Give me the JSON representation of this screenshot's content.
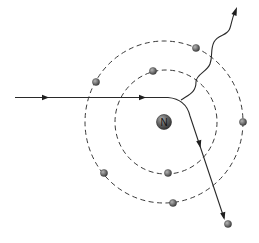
{
  "diagram": {
    "type": "atom-scattering",
    "nucleus": {
      "label": "N",
      "cx": 164,
      "cy": 122,
      "r": 7.5
    },
    "orbits": [
      {
        "name": "inner-orbit",
        "cx": 166,
        "cy": 122,
        "rx": 51,
        "ry": 52
      },
      {
        "name": "outer-orbit",
        "cx": 164,
        "cy": 122,
        "rx": 79,
        "ry": 81
      }
    ],
    "electrons": [
      {
        "cx": 96,
        "cy": 82
      },
      {
        "cx": 153,
        "cy": 71
      },
      {
        "cx": 196,
        "cy": 48
      },
      {
        "cx": 243,
        "cy": 122
      },
      {
        "cx": 104,
        "cy": 173
      },
      {
        "cx": 168,
        "cy": 173
      },
      {
        "cx": 173,
        "cy": 203
      },
      {
        "cx": 228,
        "cy": 224
      }
    ],
    "incident_path": {
      "label": "incoming particle",
      "arrows": [
        45,
        142
      ]
    },
    "scattered_path": {
      "label": "scattered particle"
    },
    "emitted_photon": {
      "label": "emitted radiation"
    },
    "colors": {
      "electron": "#6e6e6e",
      "nucleus": "#5a5a5a",
      "line": "#2a2a2a"
    }
  }
}
